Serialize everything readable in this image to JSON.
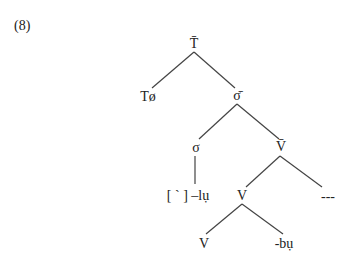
{
  "example_number": "(8)",
  "nodes": {
    "t_bar": {
      "label": "T̄",
      "x": 194,
      "y": 44
    },
    "t_null": {
      "label": "Tø",
      "x": 148,
      "y": 97
    },
    "sigma_bar": {
      "label": "σ̄",
      "x": 237,
      "y": 96
    },
    "sigma": {
      "label": "σ",
      "x": 196,
      "y": 148
    },
    "v_bar": {
      "label": "V̄",
      "x": 281,
      "y": 147
    },
    "tone_lu": {
      "label": "[ ` ] –lụ",
      "x": 188,
      "y": 196
    },
    "v_mid": {
      "label": "V",
      "x": 242,
      "y": 196
    },
    "ellipsis": {
      "label": "---",
      "x": 328,
      "y": 197
    },
    "v_low": {
      "label": "V",
      "x": 204,
      "y": 244
    },
    "bu": {
      "label": "-bụ",
      "x": 284,
      "y": 244
    }
  },
  "edges": [
    {
      "from": "t_bar",
      "to": "t_null",
      "x1": 194,
      "y1": 52,
      "x2": 152,
      "y2": 88
    },
    {
      "from": "t_bar",
      "to": "sigma_bar",
      "x1": 194,
      "y1": 52,
      "x2": 235,
      "y2": 88
    },
    {
      "from": "sigma_bar",
      "to": "sigma",
      "x1": 237,
      "y1": 104,
      "x2": 199,
      "y2": 139
    },
    {
      "from": "sigma_bar",
      "to": "v_bar",
      "x1": 237,
      "y1": 104,
      "x2": 279,
      "y2": 139
    },
    {
      "from": "sigma",
      "to": "tone_lu",
      "x1": 195,
      "y1": 156,
      "x2": 195,
      "y2": 184
    },
    {
      "from": "v_bar",
      "to": "v_mid",
      "x1": 280,
      "y1": 156,
      "x2": 246,
      "y2": 187
    },
    {
      "from": "v_bar",
      "to": "ellipsis",
      "x1": 280,
      "y1": 156,
      "x2": 322,
      "y2": 187
    },
    {
      "from": "v_mid",
      "to": "v_low",
      "x1": 242,
      "y1": 204,
      "x2": 206,
      "y2": 234
    },
    {
      "from": "v_mid",
      "to": "bu",
      "x1": 242,
      "y1": 204,
      "x2": 283,
      "y2": 234
    }
  ]
}
